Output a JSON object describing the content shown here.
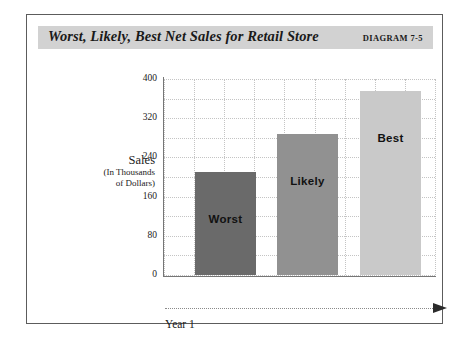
{
  "title": "Worst, Likely, Best Net Sales for Retail Store",
  "diagram_number": "DIAGRAM 7-5",
  "axis": {
    "y_title_main": "Sales",
    "y_title_sub_line1": "(In Thousands",
    "y_title_sub_line2": "of Dollars)",
    "x_label": "Year 1"
  },
  "colors": {
    "banner": "#d2d2d2",
    "frame": "#5c5c5c",
    "axis": "#767676",
    "grid": "#c4c4c4",
    "bar_worst": "#6a6a6a",
    "bar_likely": "#919191",
    "bar_best": "#c9c9c9",
    "text": "#1a1a1a"
  },
  "chart_data": {
    "type": "bar",
    "title": "Worst, Likely, Best Net Sales for Retail Store",
    "xlabel": "Year 1",
    "ylabel": "Sales (In Thousands of Dollars)",
    "categories": [
      "Worst",
      "Likely",
      "Best"
    ],
    "values": [
      210,
      288,
      376
    ],
    "ylim": [
      0,
      400
    ],
    "yticks": [
      0,
      80,
      160,
      240,
      320,
      400
    ],
    "ytick_labels": [
      "0",
      "80",
      "160",
      "240",
      "320",
      "400"
    ],
    "minor_tick_interval": 40,
    "grid": true,
    "grid_style": "dotted",
    "legend": "none",
    "bars": [
      {
        "label": "Worst",
        "value": 210,
        "color": "#6a6a6a",
        "label_color": "#111111"
      },
      {
        "label": "Likely",
        "value": 288,
        "color": "#919191",
        "label_color": "#111111"
      },
      {
        "label": "Best",
        "value": 376,
        "color": "#c9c9c9",
        "label_color": "#111111"
      }
    ]
  }
}
